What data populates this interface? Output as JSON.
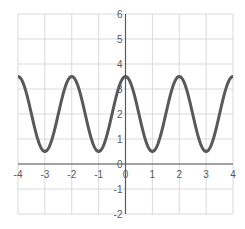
{
  "chart_data": {
    "type": "line",
    "title": "",
    "xlabel": "",
    "ylabel": "",
    "xlim": [
      -4,
      4
    ],
    "ylim": [
      -2,
      6
    ],
    "grid": true,
    "legend": null,
    "x_ticks": [
      "-4",
      "-3",
      "-2",
      "-1",
      "0",
      "1",
      "2",
      "3",
      "4"
    ],
    "y_ticks": [
      "-2",
      "-1",
      "0",
      "1",
      "2",
      "3",
      "4",
      "5",
      "6"
    ],
    "series": [
      {
        "name": "y = 2 + 1.5·cos(πx)",
        "color": "#595959",
        "x": [
          -4,
          -3,
          -2,
          -1,
          0,
          1,
          2,
          3,
          4
        ],
        "values": [
          3.5,
          0.5,
          3.5,
          0.5,
          3.5,
          0.5,
          3.5,
          0.5,
          3.5
        ]
      }
    ]
  },
  "colors": {
    "grid": "#d9d9d9",
    "axis": "#595959",
    "curve": "#595959",
    "tick_text": "#595959"
  }
}
